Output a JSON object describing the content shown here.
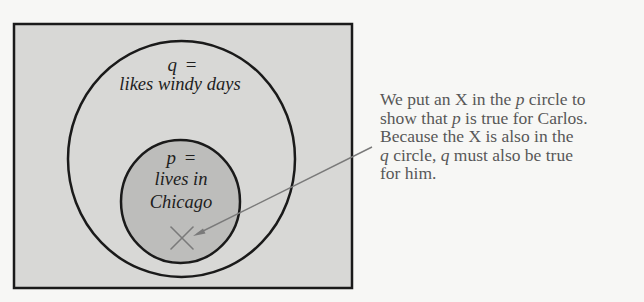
{
  "diagram": {
    "colors": {
      "page_background": "#f7f7f5",
      "box_fill": "#d8d8d6",
      "inner_circle_fill": "#bdbdbb",
      "stroke": "#1a1a1a",
      "marker_and_arrow": "#7a7a7a",
      "caption_text": "#585858"
    },
    "outer_circle": {
      "variable": "q",
      "equals": "=",
      "description": "likes windy days"
    },
    "inner_circle": {
      "variable": "p",
      "equals": "=",
      "description_line1": "lives in",
      "description_line2": "Chicago"
    },
    "marker": {
      "symbol": "X",
      "meaning": "Carlos"
    },
    "caption": {
      "line1_a": "We put an X in the ",
      "line1_var": "p",
      "line1_b": " circle to",
      "line2_a": "show that ",
      "line2_var": "p",
      "line2_b": " is true for Carlos.",
      "line3": "Because the X is also in the",
      "line4_var1": "q",
      "line4_a": " circle, ",
      "line4_var2": "q",
      "line4_b": " must also be true",
      "line5": "for him."
    }
  }
}
